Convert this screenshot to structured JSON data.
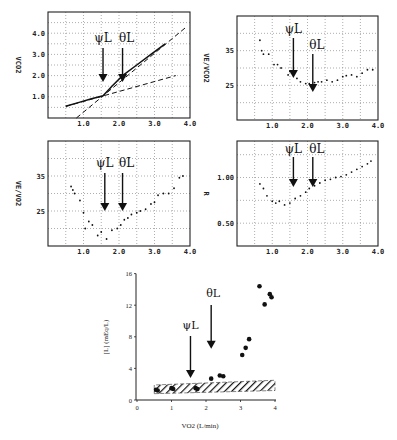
{
  "figure": {
    "annotations": {
      "psi": "ψL",
      "theta": "θL"
    }
  },
  "chart_data": [
    {
      "id": "p1",
      "type": "line",
      "title": "",
      "xlabel": "",
      "ylabel": "VCO2",
      "xlim": [
        0.0,
        4.0
      ],
      "ylim": [
        0.0,
        5.0
      ],
      "xticks": [
        "1.0",
        "2.0",
        "3.0",
        "4.0"
      ],
      "yticks": [
        "1.0",
        "2.0",
        "3.0",
        "4.0"
      ],
      "grid": true,
      "annotations": [
        {
          "label": "ψL",
          "x": 1.55
        },
        {
          "label": "θL",
          "x": 2.1
        }
      ],
      "series": [
        {
          "name": "measured VCO2",
          "style": "solid",
          "x": [
            0.5,
            0.9,
            1.2,
            1.55,
            1.8,
            2.1,
            2.5,
            2.9,
            3.3
          ],
          "y": [
            0.55,
            0.75,
            0.9,
            1.05,
            1.5,
            2.0,
            2.5,
            3.0,
            3.5
          ]
        },
        {
          "name": "lower-slope fit",
          "style": "dashed",
          "x": [
            0.5,
            3.6
          ],
          "y": [
            0.55,
            2.0
          ]
        },
        {
          "name": "upper-slope fit",
          "style": "dashed",
          "x": [
            0.8,
            3.9
          ],
          "y": [
            0.0,
            4.3
          ]
        }
      ]
    },
    {
      "id": "p2",
      "type": "scatter",
      "title": "",
      "xlabel": "",
      "ylabel": "VE/VCO2",
      "xlim": [
        0.0,
        4.0
      ],
      "ylim": [
        15,
        45
      ],
      "xticks": [
        "1.0",
        "2.0",
        "3.0",
        "4.0"
      ],
      "yticks": [
        "25",
        "35"
      ],
      "grid": true,
      "annotations": [
        {
          "label": "ψL",
          "x": 1.6
        },
        {
          "label": "θL",
          "x": 2.15
        }
      ],
      "series": [
        {
          "name": "VE/VCO2",
          "x": [
            0.65,
            0.7,
            0.75,
            0.9,
            1.05,
            1.15,
            1.25,
            1.45,
            1.5,
            1.7,
            1.8,
            1.95,
            2.05,
            2.2,
            2.3,
            2.4,
            2.55,
            2.7,
            2.85,
            3.0,
            3.1,
            3.25,
            3.4,
            3.55,
            3.7,
            3.85
          ],
          "y": [
            38,
            35,
            34,
            34,
            31,
            31,
            30,
            28,
            29,
            27,
            26,
            25.5,
            25.5,
            25.8,
            26,
            26,
            26.5,
            26,
            26.5,
            27.5,
            27.8,
            28,
            27.5,
            28.5,
            29.5,
            29.5
          ]
        }
      ]
    },
    {
      "id": "p3",
      "type": "scatter",
      "title": "",
      "xlabel": "",
      "ylabel": "VE/VO2",
      "xlim": [
        0.0,
        4.0
      ],
      "ylim": [
        15,
        45
      ],
      "xticks": [
        "1.0",
        "2.0",
        "3.0",
        "4.0"
      ],
      "yticks": [
        "25",
        "35"
      ],
      "grid": true,
      "annotations": [
        {
          "label": "ψL",
          "x": 1.6
        },
        {
          "label": "θL",
          "x": 2.1
        }
      ],
      "series": [
        {
          "name": "VE/VO2",
          "x": [
            0.65,
            0.7,
            0.75,
            0.9,
            1.0,
            1.05,
            1.15,
            1.25,
            1.4,
            1.5,
            1.65,
            1.8,
            1.95,
            2.05,
            2.15,
            2.25,
            2.35,
            2.5,
            2.6,
            2.75,
            2.9,
            3.0,
            3.1,
            3.25,
            3.4,
            3.55,
            3.7,
            3.8
          ],
          "y": [
            32,
            31,
            30,
            28,
            24.5,
            20,
            22,
            21,
            18,
            19,
            17,
            19.5,
            20,
            21,
            22.5,
            23,
            24,
            24.5,
            25,
            25.5,
            27,
            27.5,
            29.5,
            30,
            30,
            31.5,
            34.5,
            35
          ]
        }
      ]
    },
    {
      "id": "p4",
      "type": "scatter",
      "title": "",
      "xlabel": "",
      "ylabel": "R",
      "xlim": [
        0.0,
        4.0
      ],
      "ylim": [
        0.25,
        1.4
      ],
      "xticks": [
        "1.0",
        "2.0",
        "3.0",
        "4.0"
      ],
      "yticks": [
        "0.50",
        "1.00"
      ],
      "grid": true,
      "annotations": [
        {
          "label": "ψL",
          "x": 1.6
        },
        {
          "label": "θL",
          "x": 2.15
        }
      ],
      "series": [
        {
          "name": "R",
          "x": [
            0.65,
            0.75,
            0.85,
            1.0,
            1.1,
            1.2,
            1.35,
            1.5,
            1.65,
            1.8,
            1.95,
            2.05,
            2.2,
            2.35,
            2.5,
            2.65,
            2.8,
            2.95,
            3.1,
            3.25,
            3.4,
            3.55,
            3.7,
            3.8
          ],
          "y": [
            0.93,
            0.88,
            0.8,
            0.74,
            0.72,
            0.74,
            0.7,
            0.72,
            0.77,
            0.8,
            0.84,
            0.88,
            0.91,
            0.94,
            0.97,
            0.98,
            1.0,
            1.01,
            1.03,
            1.06,
            1.09,
            1.12,
            1.15,
            1.18
          ]
        }
      ]
    },
    {
      "id": "p5",
      "type": "scatter",
      "title": "",
      "xlabel": "VO2   (L/min)",
      "ylabel": "[L]   (mEq/L)",
      "xlim": [
        0,
        4
      ],
      "ylim": [
        0,
        16
      ],
      "xticks": [
        "0",
        "1",
        "2",
        "3",
        "4"
      ],
      "yticks": [
        "0",
        "4",
        "8",
        "12",
        "16"
      ],
      "grid": false,
      "annotations": [
        {
          "label": "ψL",
          "x": 1.55,
          "arrow_tip_y": 2.8
        },
        {
          "label": "θL",
          "x": 2.15,
          "arrow_tip_y": 6.5
        }
      ],
      "band": {
        "name": "resting range (hatched)",
        "x": [
          0.5,
          4.0
        ],
        "y_low_start": 0.8,
        "y_high_start": 1.9,
        "y_low_end": 1.2,
        "y_high_end": 2.5
      },
      "series": [
        {
          "name": "lactate",
          "x": [
            0.55,
            0.6,
            1.0,
            1.05,
            1.7,
            1.75,
            2.15,
            2.4,
            2.5,
            3.05,
            3.15,
            3.25,
            3.55,
            3.7,
            3.85,
            3.9
          ],
          "y": [
            1.3,
            1.2,
            1.5,
            1.4,
            1.5,
            1.4,
            2.7,
            3.1,
            3.0,
            5.7,
            6.6,
            7.7,
            14.4,
            12.1,
            13.4,
            13.0
          ]
        }
      ]
    }
  ]
}
